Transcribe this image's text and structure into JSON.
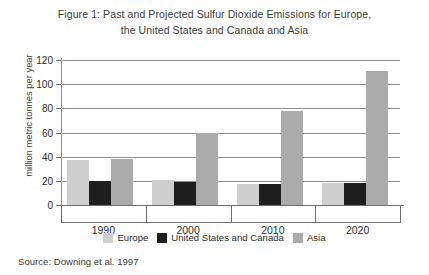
{
  "title": {
    "line1": "Figure 1: Past and Projected Sulfur Dioxide Emissions for Europe,",
    "line2": "the United States and Canada and Asia"
  },
  "source_note": "Source: Downing et al. 1997",
  "legend": {
    "items": [
      {
        "label": "Europe",
        "color": "#cfcfcf",
        "key": "europe"
      },
      {
        "label": "United States and Canada",
        "color": "#1e1e1e",
        "key": "united-states"
      },
      {
        "label": "Asia",
        "color": "#ababab",
        "key": "asia"
      }
    ]
  },
  "chart_data": {
    "type": "bar",
    "title": "Figure 1: Past and Projected Sulfur Dioxide Emissions for Europe, the United States and Canada and Asia",
    "xlabel": "",
    "ylabel": "million metric tonnes per year",
    "categories": [
      "1990",
      "2000",
      "2010",
      "2020"
    ],
    "series": [
      {
        "name": "Europe",
        "color": "#cfcfcf",
        "values": [
          37,
          21,
          17,
          18
        ]
      },
      {
        "name": "United States and Canada",
        "color": "#1e1e1e",
        "values": [
          20,
          19,
          17,
          18
        ]
      },
      {
        "name": "Asia",
        "color": "#ababab",
        "values": [
          38,
          60,
          78,
          111
        ]
      }
    ],
    "ylim": [
      0,
      120
    ],
    "yticks": [
      0,
      20,
      40,
      60,
      80,
      100,
      120
    ],
    "ytick_labels": [
      "0",
      "20",
      "40",
      "60",
      "80",
      "100",
      "120"
    ],
    "grid": true,
    "legend_position": "bottom",
    "source": "Downing et al. 1997"
  }
}
